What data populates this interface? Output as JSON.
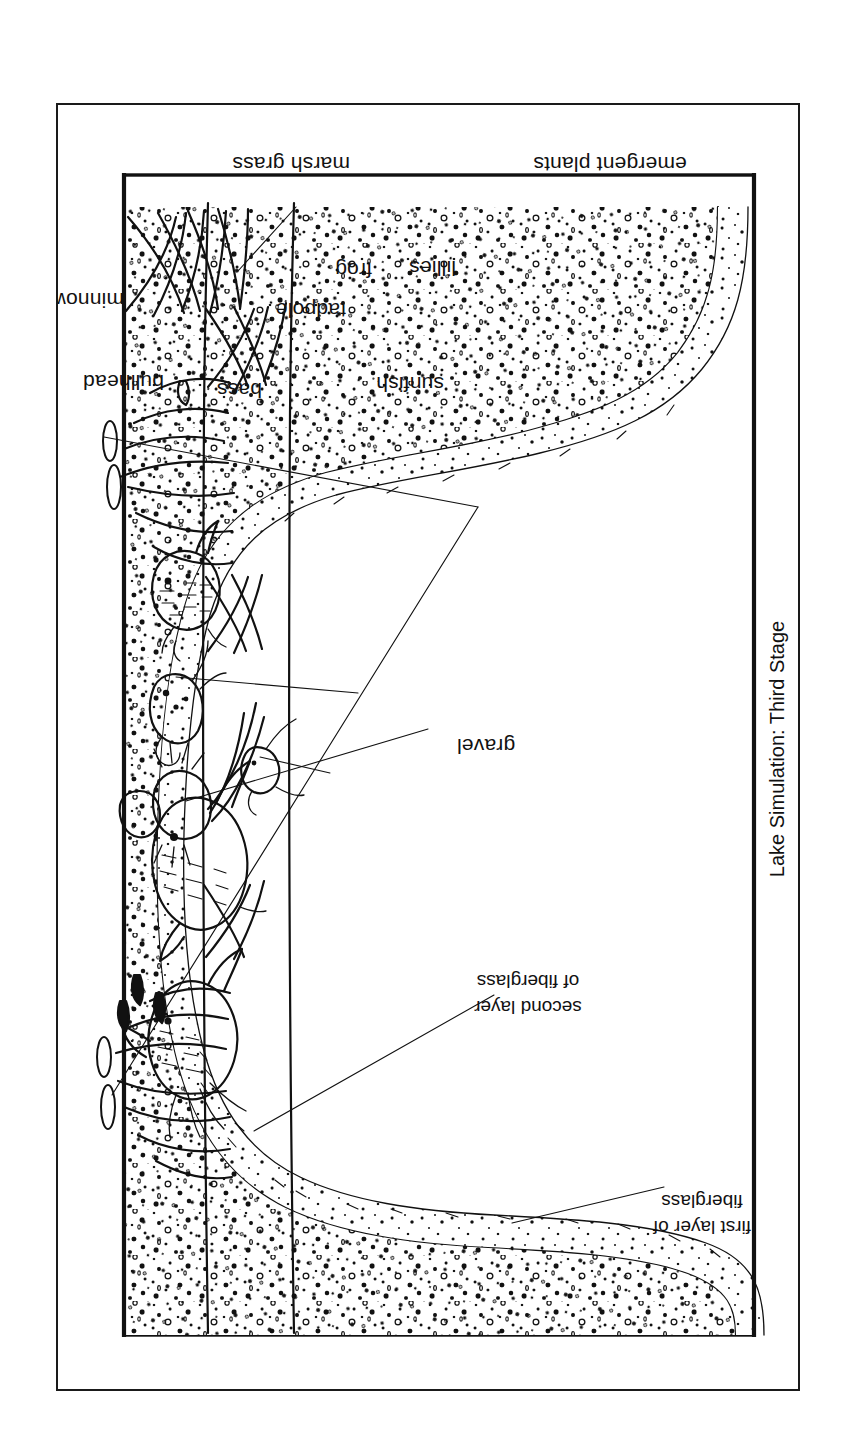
{
  "figure": {
    "caption": "Lake Simulation: Third Stage",
    "kind": "cross-section-diagram",
    "orientation": "rotated-90-ccw"
  },
  "labels": {
    "marsh_grass": "marsh grass",
    "emergent_plants": "emergent plants",
    "lillies": "lillies",
    "frog": "frog",
    "tadpole": "tadpole",
    "sunfish": "sunfish",
    "bass": "bass",
    "bullhead": "bullhead",
    "minnows": "minnows",
    "gravel": "gravel",
    "second_layer_line1": "second layer",
    "second_layer_line2": "of fiberglass",
    "first_layer_line1": "first layer of",
    "first_layer_line2": "fiberglass"
  },
  "colors": {
    "ink": "#111111",
    "paper": "#ffffff"
  }
}
